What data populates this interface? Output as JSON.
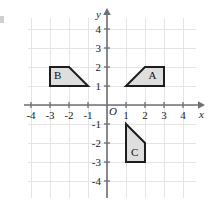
{
  "chart_data": {
    "type": "scatter",
    "title": "",
    "xlabel": "x",
    "ylabel": "y",
    "origin_label": "O",
    "xlim": [
      -5,
      5
    ],
    "ylim": [
      -5,
      5
    ],
    "grid": true,
    "legend": "none",
    "x_ticks": [
      -4,
      -3,
      -2,
      -1,
      1,
      2,
      3,
      4
    ],
    "y_ticks": [
      4,
      3,
      2,
      1,
      -1,
      -2,
      -3,
      -4
    ],
    "x_tick_labels": [
      "-4",
      "-3",
      "-2",
      "-1",
      "1",
      "2",
      "3",
      "4"
    ],
    "y_tick_labels": [
      "4",
      "3",
      "2",
      "1",
      "-1",
      "-2",
      "-3",
      "-4"
    ],
    "shapes": [
      {
        "label": "A",
        "vertices": [
          [
            1,
            1
          ],
          [
            2,
            2
          ],
          [
            3,
            2
          ],
          [
            3,
            1
          ]
        ],
        "label_position": [
          2.4,
          1.5
        ],
        "fill": "#dedede",
        "stroke": "#1d1d1d"
      },
      {
        "label": "B",
        "vertices": [
          [
            -3,
            2
          ],
          [
            -2,
            2
          ],
          [
            -1,
            1
          ],
          [
            -3,
            1
          ]
        ],
        "label_position": [
          -2.6,
          1.5
        ],
        "fill": "#dedede",
        "stroke": "#1d1d1d"
      },
      {
        "label": "C",
        "vertices": [
          [
            1,
            -1
          ],
          [
            2,
            -2
          ],
          [
            2,
            -3
          ],
          [
            1,
            -3
          ]
        ],
        "label_position": [
          1.45,
          -2.55
        ],
        "fill": "#dedede",
        "stroke": "#1d1d1d"
      }
    ]
  },
  "figure": {
    "grid_color": "#e4e4e6",
    "axis_color": "#6f6f74",
    "text_color": "#1b1b1b"
  }
}
